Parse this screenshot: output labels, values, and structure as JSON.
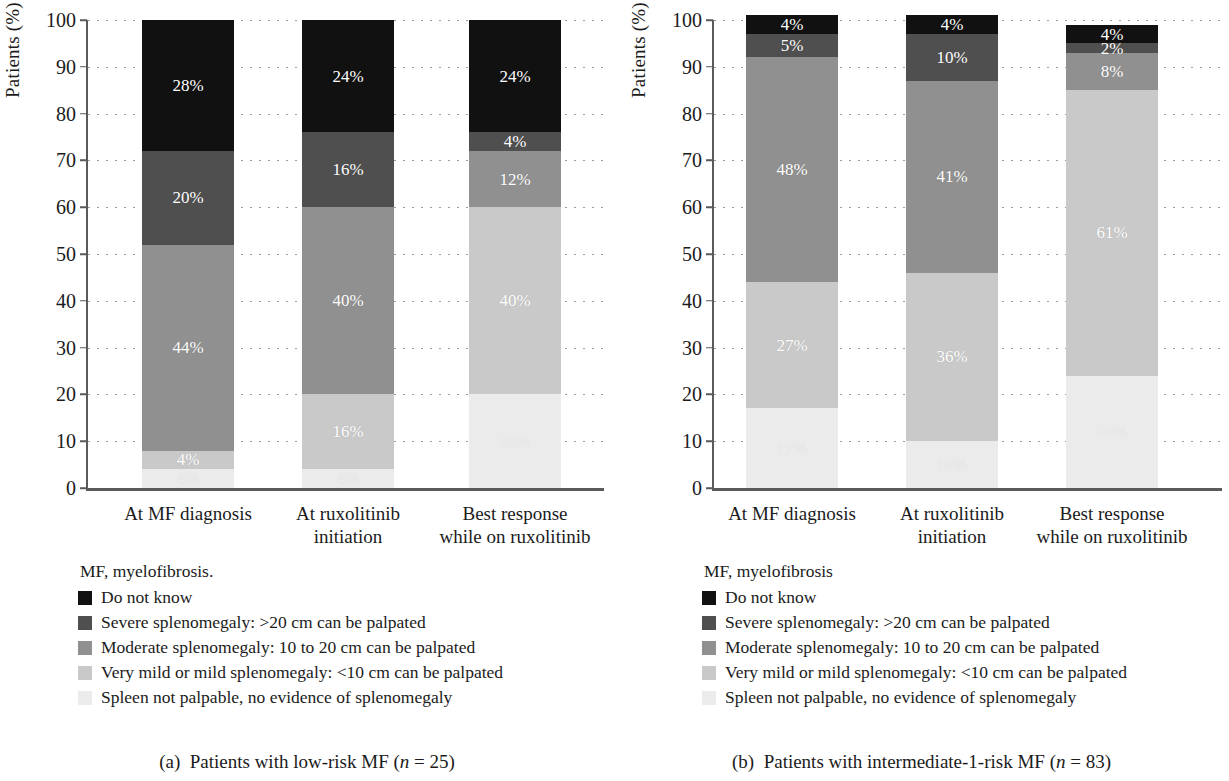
{
  "figure": {
    "axis": {
      "ylabel": "Patients (%)",
      "yticks": [
        "0",
        "10",
        "20",
        "30",
        "40",
        "50",
        "60",
        "70",
        "80",
        "90",
        "100"
      ],
      "ymin": 0,
      "ymax": 100
    },
    "categories": [
      "At MF diagnosis",
      "At ruxolitinib\ninitiation",
      "Best response\nwhile on ruxolitinib"
    ],
    "series_order": [
      "Do not know",
      "Severe splenomegaly",
      "Moderate splenomegaly",
      "Very mild or mild splenomegaly",
      "Spleen not palpable"
    ],
    "colors": {
      "do_not_know": "#111111",
      "severe": "#4f4f4f",
      "moderate": "#909090",
      "very_mild": "#c9c9c9",
      "not_palpable": "#ebebeb",
      "axis": "#5a5a5a",
      "grid": "#9a9a9a",
      "text": "#1b1b1b"
    },
    "legend": {
      "items": [
        {
          "label": "Do not know",
          "color": "#111111"
        },
        {
          "label": "Severe splenomegaly: >20 cm can be palpated",
          "color": "#4f4f4f"
        },
        {
          "label": "Moderate splenomegaly: 10 to 20 cm can be palpated",
          "color": "#909090"
        },
        {
          "label": "Very mild or mild splenomegaly: <10 cm can be palpated",
          "color": "#c9c9c9"
        },
        {
          "label": "Spleen not palpable, no evidence of splenomegaly",
          "color": "#ebebeb"
        }
      ]
    },
    "panel_a": {
      "note": "MF, myelofibrosis.",
      "caption_prefix": "(a)",
      "caption_text": "Patients with low-risk MF (",
      "caption_n": "n",
      "caption_suffix": " = 25)"
    },
    "panel_b": {
      "note": "MF, myelofibrosis",
      "caption_prefix": "(b)",
      "caption_text": "Patients with intermediate-1-risk MF (",
      "caption_n": "n",
      "caption_suffix": " = 83)"
    }
  },
  "chart_data": [
    {
      "type": "bar",
      "stacked": true,
      "panel": "a",
      "title": "(a) Patients with low-risk MF (n = 25)",
      "xlabel": "",
      "ylabel": "Patients (%)",
      "ylim": [
        0,
        100
      ],
      "ytick_step": 10,
      "grid": true,
      "legend_position": "below-left",
      "categories": [
        "At MF diagnosis",
        "At ruxolitinib initiation",
        "Best response while on ruxolitinib"
      ],
      "series": [
        {
          "name": "Spleen not palpable, no evidence of splenomegaly",
          "color": "#ebebeb",
          "values": [
            4,
            4,
            20
          ],
          "labels": [
            "4%",
            "4%",
            "20%"
          ]
        },
        {
          "name": "Very mild or mild splenomegaly: <10 cm can be palpated",
          "color": "#c9c9c9",
          "values": [
            4,
            16,
            40
          ],
          "labels": [
            "4%",
            "16%",
            "40%"
          ]
        },
        {
          "name": "Moderate splenomegaly: 10 to 20 cm can be palpated",
          "color": "#909090",
          "values": [
            44,
            40,
            12
          ],
          "labels": [
            "44%",
            "40%",
            "12%"
          ]
        },
        {
          "name": "Severe splenomegaly: >20 cm can be palpated",
          "color": "#4f4f4f",
          "values": [
            20,
            16,
            4
          ],
          "labels": [
            "20%",
            "16%",
            "4%"
          ]
        },
        {
          "name": "Do not know",
          "color": "#111111",
          "values": [
            28,
            24,
            24
          ],
          "labels": [
            "28%",
            "24%",
            "24%"
          ]
        }
      ],
      "bar_totals": [
        100,
        100,
        100
      ]
    },
    {
      "type": "bar",
      "stacked": true,
      "panel": "b",
      "title": "(b) Patients with intermediate-1-risk MF (n = 83)",
      "xlabel": "",
      "ylabel": "Patients (%)",
      "ylim": [
        0,
        100
      ],
      "ytick_step": 10,
      "grid": true,
      "legend_position": "below-left",
      "categories": [
        "At MF diagnosis",
        "At ruxolitinib initiation",
        "Best response while on ruxolitinib"
      ],
      "series": [
        {
          "name": "Spleen not palpable, no evidence of splenomegaly",
          "color": "#ebebeb",
          "values": [
            17,
            10,
            24
          ],
          "labels": [
            "17%",
            "10%",
            "24%"
          ]
        },
        {
          "name": "Very mild or mild splenomegaly: <10 cm can be palpated",
          "color": "#c9c9c9",
          "values": [
            27,
            36,
            61
          ],
          "labels": [
            "27%",
            "36%",
            "61%"
          ]
        },
        {
          "name": "Moderate splenomegaly: 10 to 20 cm can be palpated",
          "color": "#909090",
          "values": [
            48,
            41,
            8
          ],
          "labels": [
            "48%",
            "41%",
            "8%"
          ]
        },
        {
          "name": "Severe splenomegaly: >20 cm can be palpated",
          "color": "#4f4f4f",
          "values": [
            5,
            10,
            2
          ],
          "labels": [
            "5%",
            "10%",
            "2%"
          ]
        },
        {
          "name": "Do not know",
          "color": "#111111",
          "values": [
            4,
            4,
            4
          ],
          "labels": [
            "4%",
            "4%",
            "4%"
          ]
        }
      ],
      "bar_totals": [
        101,
        101,
        99
      ]
    }
  ]
}
